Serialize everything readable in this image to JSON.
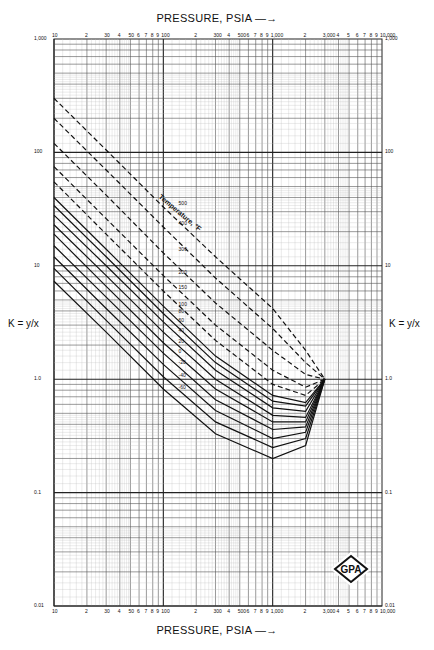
{
  "header": {
    "top_axis_title": "PRESSURE, PSIA —→",
    "bottom_axis_title": "PRESSURE, PSIA —→"
  },
  "left_axis_label": "K = y/x",
  "right_axis_label": "K = y/x",
  "x_ticks": [
    "10",
    "2",
    "30",
    "4",
    "50",
    "6",
    "7",
    "8",
    "9",
    "100",
    "2",
    "300",
    "4",
    "500",
    "6",
    "7",
    "8",
    "9",
    "1,000",
    "2",
    "3,000",
    "4",
    "5",
    "6",
    "7",
    "8",
    "9",
    "10,000"
  ],
  "x_major_labels": [
    "10",
    "30",
    "50",
    "100",
    "300",
    "500",
    "1,000",
    "3,000",
    "10,000"
  ],
  "y_major_labels": [
    "1,000",
    "100",
    "10",
    "1.0",
    "0.1",
    "0.01"
  ],
  "curve_label_title": "Temperature, °F",
  "logo_text": "GPA",
  "chart_data": {
    "type": "line",
    "xlabel": "PRESSURE, PSIA",
    "ylabel": "K = y/x",
    "xscale": "log",
    "yscale": "log",
    "xlim": [
      10,
      10000
    ],
    "ylim": [
      0.01,
      1000
    ],
    "grid": true,
    "legend": "inline curve labels along diagonal, title 'Temperature, °F'",
    "convergence_pressure_psia": 3000,
    "convergence_K": 1.0,
    "series": [
      {
        "name": "500 °F",
        "style": "dashed",
        "x": [
          10,
          30,
          100,
          300,
          1000,
          2000,
          3000
        ],
        "values": [
          300,
          105,
          33,
          12,
          4.2,
          1.8,
          1.0
        ]
      },
      {
        "name": "400 °F",
        "style": "dashed",
        "x": [
          10,
          30,
          100,
          300,
          1000,
          2000,
          3000
        ],
        "values": [
          200,
          70,
          22,
          7.8,
          2.8,
          1.4,
          1.0
        ]
      },
      {
        "name": "300 °F",
        "style": "dashed",
        "x": [
          10,
          30,
          100,
          300,
          1000,
          2000,
          3000
        ],
        "values": [
          120,
          42,
          13,
          4.7,
          1.8,
          1.1,
          1.0
        ]
      },
      {
        "name": "200 °F",
        "style": "dashed",
        "x": [
          10,
          30,
          100,
          300,
          1000,
          2000,
          3000
        ],
        "values": [
          75,
          26,
          8.2,
          3.0,
          1.2,
          0.85,
          1.0
        ]
      },
      {
        "name": "150 °F",
        "style": "dashed",
        "x": [
          10,
          30,
          100,
          300,
          1000,
          2000,
          3000
        ],
        "values": [
          55,
          19,
          6.0,
          2.2,
          0.9,
          0.72,
          1.0
        ]
      },
      {
        "name": "100 °F",
        "style": "solid",
        "x": [
          10,
          30,
          100,
          300,
          1000,
          2000,
          3000
        ],
        "values": [
          40,
          14,
          4.4,
          1.6,
          0.72,
          0.62,
          1.0
        ]
      },
      {
        "name": "80 °F",
        "style": "solid",
        "x": [
          10,
          30,
          100,
          300,
          1000,
          2000,
          3000
        ],
        "values": [
          34,
          12,
          3.8,
          1.4,
          0.64,
          0.58,
          1.0
        ]
      },
      {
        "name": "60 °F",
        "style": "solid",
        "x": [
          10,
          30,
          100,
          300,
          1000,
          2000,
          3000
        ],
        "values": [
          28,
          10,
          3.2,
          1.2,
          0.56,
          0.52,
          1.0
        ]
      },
      {
        "name": "40 °F",
        "style": "solid",
        "x": [
          10,
          30,
          100,
          300,
          1000,
          2000,
          3000
        ],
        "values": [
          23,
          8.2,
          2.6,
          1.0,
          0.48,
          0.46,
          1.0
        ]
      },
      {
        "name": "20 °F",
        "style": "solid",
        "x": [
          10,
          30,
          100,
          300,
          1000,
          2000,
          3000
        ],
        "values": [
          19,
          6.6,
          2.1,
          0.82,
          0.42,
          0.42,
          1.0
        ]
      },
      {
        "name": "0 °F",
        "style": "solid",
        "x": [
          10,
          30,
          100,
          300,
          1000,
          2000,
          3000
        ],
        "values": [
          15,
          5.3,
          1.7,
          0.66,
          0.36,
          0.38,
          1.0
        ]
      },
      {
        "name": "-20 °F",
        "style": "solid",
        "x": [
          10,
          30,
          100,
          300,
          1000,
          2000,
          3000
        ],
        "values": [
          12,
          4.2,
          1.35,
          0.53,
          0.3,
          0.34,
          1.0
        ]
      },
      {
        "name": "-40 °F",
        "style": "solid",
        "x": [
          10,
          30,
          100,
          300,
          1000,
          2000,
          3000
        ],
        "values": [
          9.5,
          3.3,
          1.05,
          0.42,
          0.25,
          0.3,
          1.0
        ]
      },
      {
        "name": "-60 °F",
        "style": "solid",
        "x": [
          10,
          30,
          100,
          300,
          1000,
          2000,
          3000
        ],
        "values": [
          7.3,
          2.6,
          0.82,
          0.33,
          0.2,
          0.26,
          1.0
        ]
      }
    ]
  }
}
